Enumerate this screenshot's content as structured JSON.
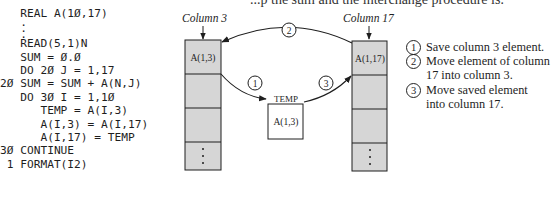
{
  "page": {
    "top_text_partial": "...p      the sum and the interchange procedure is:"
  },
  "code": {
    "lines": [
      {
        "label": "",
        "text": "   REAL A(10,17)"
      },
      {
        "label": "",
        "text": "   :"
      },
      {
        "label": "",
        "text": "   READ(5,1)N"
      },
      {
        "label": "",
        "text": "   SUM = 0.0"
      },
      {
        "label": "",
        "text": "   DO 20 J = 1,17"
      },
      {
        "label": "20",
        "text": "20 SUM = SUM + A(N,J)"
      },
      {
        "label": "",
        "text": "   DO 30 I = 1,10"
      },
      {
        "label": "",
        "text": "      TEMP = A(I,3)"
      },
      {
        "label": "",
        "text": "      A(I,3) = A(I,17)"
      },
      {
        "label": "",
        "text": "      A(I,17) = TEMP"
      },
      {
        "label": "30",
        "text": "30 CONTINUE"
      },
      {
        "label": "1",
        "text": " 1 FORMAT(I2)"
      }
    ],
    "line0": "   REAL A(1Ø,17)",
    "line1": "   READ(5,1)N",
    "line2": "   SUM = Ø.Ø",
    "line3": "   DO 2Ø J = 1,17",
    "line4": "2Ø SUM = SUM + A(N,J)",
    "line5": "   DO 3Ø I = 1,1Ø",
    "line6": "      TEMP = A(I,3)",
    "line7": "      A(I,3) = A(I,17)",
    "line8": "      A(I,17) = TEMP",
    "line9": "3Ø CONTINUE",
    "line10": " 1 FORMAT(I2)",
    "ellipsis": "   ."
  },
  "diagram": {
    "column_left_label": "Column 3",
    "column_right_label": "Column 17",
    "left_cell": "A(1,3)",
    "right_cell": "A(1,17)",
    "temp_label": "TEMP",
    "temp_cell": "A(1,3)",
    "step1": "1",
    "step2": "2",
    "step3": "3",
    "vertical_ellipsis": "⋮",
    "colors": {
      "cell_fill": "#d6d6d6",
      "stroke": "#1e1e1e",
      "temp_fill": "#ffffff"
    }
  },
  "legend": {
    "items": [
      {
        "num": "1",
        "text": "Save column 3 element."
      },
      {
        "num": "2",
        "text": "Move element of column",
        "text2": "17 into column 3."
      },
      {
        "num": "3",
        "text": "Move saved element",
        "text2": "into column 17."
      }
    ]
  }
}
